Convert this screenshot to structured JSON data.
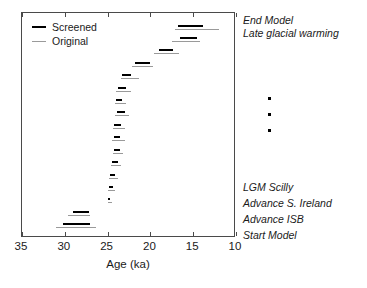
{
  "chart_data": {
    "type": "bar",
    "title": "",
    "xlabel": "Age (ka)",
    "ylabel": "",
    "xlim": [
      35,
      10
    ],
    "xticks": [
      35,
      30,
      25,
      20,
      15,
      10
    ],
    "xtick_labels": [
      "35",
      "30",
      "25",
      "20",
      "15",
      "10"
    ],
    "grid": false,
    "axis_reversed": true,
    "legend_position": "top-left",
    "legend": [
      {
        "name": "Screened",
        "color": "#000000",
        "linewidth": "thick"
      },
      {
        "name": "Original",
        "color": "#9a9a9a",
        "linewidth": "thin"
      }
    ],
    "series": [
      {
        "name": "Screened",
        "color": "#000000"
      },
      {
        "name": "Original",
        "color": "#9a9a9a"
      }
    ],
    "rows": [
      {
        "index": 1,
        "label": "End Model",
        "screened": [
          16.8,
          13.8
        ],
        "original": [
          17.1,
          12.0
        ]
      },
      {
        "index": 2,
        "label": "Late glacial warming",
        "screened": [
          16.5,
          14.5
        ],
        "original": [
          17.5,
          14.2
        ]
      },
      {
        "index": 3,
        "label": "",
        "screened": [
          19.0,
          17.4
        ],
        "original": [
          19.6,
          16.7
        ]
      },
      {
        "index": 4,
        "label": "",
        "screened": [
          21.8,
          20.0
        ],
        "original": [
          22.1,
          19.7
        ]
      },
      {
        "index": 5,
        "label": "",
        "screened": [
          23.3,
          22.3
        ],
        "original": [
          23.4,
          21.3
        ]
      },
      {
        "index": 6,
        "label": "",
        "screened": [
          23.8,
          22.9
        ],
        "original": [
          24.0,
          22.3
        ]
      },
      {
        "index": 7,
        "label": "",
        "screened": [
          24.0,
          23.3
        ],
        "original": [
          24.1,
          22.9
        ]
      },
      {
        "index": 8,
        "label": "",
        "screened": [
          23.9,
          23.0
        ],
        "original": [
          24.1,
          22.5
        ]
      },
      {
        "index": 9,
        "label": "",
        "screened": [
          24.2,
          23.4
        ],
        "original": [
          24.4,
          23.0
        ]
      },
      {
        "index": 10,
        "label": "",
        "screened": [
          24.3,
          23.5
        ],
        "original": [
          24.5,
          23.0
        ]
      },
      {
        "index": 11,
        "label": "",
        "screened": [
          24.2,
          23.6
        ],
        "original": [
          24.4,
          23.2
        ]
      },
      {
        "index": 12,
        "label": "",
        "screened": [
          24.5,
          23.8
        ],
        "original": [
          24.6,
          23.4
        ]
      },
      {
        "index": 13,
        "label": "",
        "screened": [
          24.7,
          24.1
        ],
        "original": [
          24.8,
          23.8
        ]
      },
      {
        "index": 14,
        "label": "LGM Scilly",
        "screened": [
          24.8,
          24.4
        ],
        "original": [
          24.9,
          24.1
        ]
      },
      {
        "index": 15,
        "label": "Advance S. Ireland",
        "screened": [
          25.0,
          24.7
        ],
        "original": [
          25.0,
          24.5
        ]
      },
      {
        "index": 16,
        "label": "Advance ISB",
        "screened": [
          29.0,
          27.2
        ],
        "original": [
          29.6,
          27.0
        ]
      },
      {
        "index": 17,
        "label": "Start Model",
        "screened": [
          30.2,
          27.0
        ],
        "original": [
          31.0,
          26.3
        ]
      }
    ],
    "omitted_rows_marker": "vertical-ellipsis",
    "annotations_right": [
      "End Model",
      "Late glacial warming",
      "LGM Scilly",
      "Advance S. Ireland",
      "Advance ISB",
      "Start Model"
    ]
  },
  "legend": {
    "screened_label": "Screened",
    "original_label": "Original"
  },
  "axis": {
    "title": "Age (ka)",
    "ticks": [
      "35",
      "30",
      "25",
      "20",
      "15",
      "10"
    ]
  },
  "annotations": {
    "end_model": "End Model",
    "late_glacial_warming": "Late glacial warming",
    "lgm_scilly": "LGM Scilly",
    "advance_s_ireland": "Advance S. Ireland",
    "advance_isb": "Advance ISB",
    "start_model": "Start Model"
  }
}
